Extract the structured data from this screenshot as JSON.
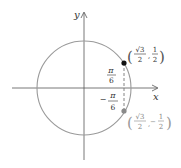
{
  "diagram": {
    "axes": {
      "x_label": "x",
      "y_label": "y"
    },
    "circle": {
      "description": "unit circle"
    },
    "points": [
      {
        "angle_label": {
          "sign": "",
          "num": "π",
          "den": "6"
        },
        "coord": {
          "x_num": "√3",
          "x_den": "2",
          "y_sign": "",
          "y_num": "1",
          "y_den": "2"
        },
        "color": "#111111"
      },
      {
        "angle_label": {
          "sign": "−",
          "num": "π",
          "den": "6"
        },
        "coord": {
          "x_num": "√3",
          "x_den": "2",
          "y_sign": "−",
          "y_num": "1",
          "y_den": "2"
        },
        "color": "#8a8a8a"
      }
    ],
    "colors": {
      "circle": "#9a9a9a",
      "axes": "#555555",
      "dashed": "#777777"
    }
  }
}
